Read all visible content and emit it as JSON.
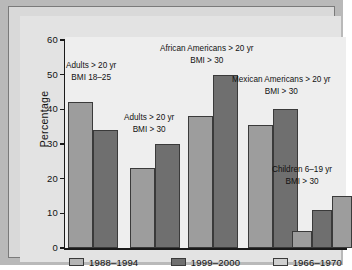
{
  "chart_data": {
    "type": "bar",
    "title": "",
    "xlabel": "",
    "ylabel": "Percentage",
    "ylim": [
      0,
      60
    ],
    "yticks": [
      "0",
      "10",
      "20",
      "30",
      "40",
      "50",
      "60"
    ],
    "grid": false,
    "legend_position": "bottom",
    "legend": [
      "1988–1994",
      "1999–2000",
      "1966–1970"
    ],
    "categories": [
      "Adults > 20 yr BMI 18–25",
      "Adults > 20 yr BMI > 30",
      "African Americans > 20 yr BMI > 30",
      "Mexican Americans > 20 yr BMI > 30",
      "Children 6–19 yr BMI > 30"
    ],
    "groups": [
      {
        "label_line1": "Adults > 20 yr",
        "label_line2": "BMI 18–25",
        "bars": [
          {
            "series": "1988–1994",
            "value": 42,
            "shade": "light"
          },
          {
            "series": "1999–2000",
            "value": 34,
            "shade": "dark"
          }
        ]
      },
      {
        "label_line1": "Adults > 20 yr",
        "label_line2": "BMI > 30",
        "bars": [
          {
            "series": "1988–1994",
            "value": 23,
            "shade": "light"
          },
          {
            "series": "1999–2000",
            "value": 30,
            "shade": "dark"
          }
        ]
      },
      {
        "label_line1": "African Americans > 20 yr",
        "label_line2": "BMI > 30",
        "bars": [
          {
            "series": "1988–1994",
            "value": 38,
            "shade": "light"
          },
          {
            "series": "1999–2000",
            "value": 50,
            "shade": "dark"
          }
        ]
      },
      {
        "label_line1": "Mexican Americans > 20 yr",
        "label_line2": "BMI > 30",
        "bars": [
          {
            "series": "1988–1994",
            "value": 35.5,
            "shade": "light"
          },
          {
            "series": "1999–2000",
            "value": 40,
            "shade": "dark"
          }
        ]
      },
      {
        "label_line1": "Children 6–19 yr",
        "label_line2": "BMI > 30",
        "bars": [
          {
            "series": "1966–1970",
            "value": 5,
            "shade": "light"
          },
          {
            "series": "1988–1994",
            "value": 11,
            "shade": "dark"
          },
          {
            "series": "1999–2000",
            "value": 15,
            "shade": "light"
          }
        ]
      }
    ],
    "colors": {
      "light_bar": "#9d9d9d",
      "dark_bar": "#6f6f6f",
      "panel_bg": "#eeeeee",
      "figure_bg": "#b9b9b9",
      "axis": "#1a1a1a"
    }
  },
  "axis": {
    "y_title": "Percentage",
    "ticks": [
      {
        "label": "60",
        "value": 60
      },
      {
        "label": "50",
        "value": 50
      },
      {
        "label": "40",
        "value": 40
      },
      {
        "label": "30",
        "value": 30
      },
      {
        "label": "20",
        "value": 20
      },
      {
        "label": "10",
        "value": 10
      },
      {
        "label": "0",
        "value": 0
      }
    ]
  },
  "legend": {
    "items": [
      {
        "label": "1988–1994",
        "shade": "light"
      },
      {
        "label": "1999–2000",
        "shade": "dark"
      },
      {
        "label": "1966–1970",
        "shade": "light2"
      }
    ]
  }
}
